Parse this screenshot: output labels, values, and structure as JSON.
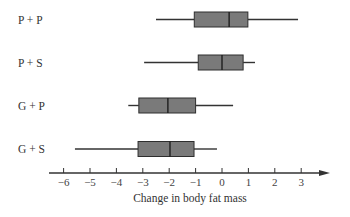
{
  "chart_data": {
    "type": "boxplot",
    "title": "",
    "xlabel": "Change in body fat mass",
    "ylabel": "",
    "xlim": [
      -6.6,
      4.0
    ],
    "x_ticks": [
      -6,
      -5,
      -4,
      -3,
      -2,
      -1,
      0,
      1,
      2,
      3
    ],
    "x_tick_labels": [
      "−6",
      "−5",
      "−4",
      "−3",
      "−2",
      "−1",
      "0",
      "1",
      "2",
      "3"
    ],
    "grid": false,
    "orientation": "horizontal",
    "categories": [
      "P + P",
      "P + S",
      "G + P",
      "G + S"
    ],
    "series": [
      {
        "name": "P + P",
        "min": -2.5,
        "q1": -1.05,
        "median": 0.27,
        "q3": 0.98,
        "max": 2.88
      },
      {
        "name": "P + S",
        "min": -2.95,
        "q1": -0.9,
        "median": 0.0,
        "q3": 0.8,
        "max": 1.25
      },
      {
        "name": "G + P",
        "min": -3.55,
        "q1": -3.15,
        "median": -2.05,
        "q3": -1.0,
        "max": 0.42
      },
      {
        "name": "G + S",
        "min": -5.57,
        "q1": -3.18,
        "median": -1.97,
        "q3": -1.06,
        "max": -0.19
      }
    ],
    "colors": {
      "box_fill": "#7a7a7a",
      "box_stroke": "#2e2e2e",
      "whisker": "#333333",
      "axis": "#333333"
    }
  }
}
